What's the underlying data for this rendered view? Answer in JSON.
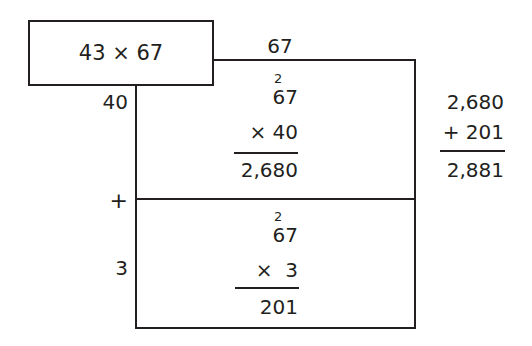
{
  "problem": {
    "label": "43 × 67"
  },
  "top_factor": "67",
  "side_factors": {
    "tens": "40",
    "plus": "+",
    "ones": "3"
  },
  "upper_cell": {
    "carry": "2",
    "multiplicand": "67",
    "multiplier": "× 40",
    "product": "2,680"
  },
  "lower_cell": {
    "carry": "2",
    "multiplicand": "67",
    "multiplier": "×  3",
    "product": "201"
  },
  "sum": {
    "addend1": "2,680",
    "addend2": "+ 201",
    "total": "2,881"
  }
}
